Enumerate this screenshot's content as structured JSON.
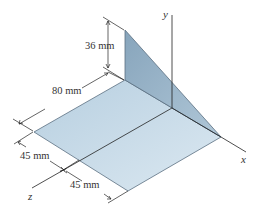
{
  "figure": {
    "type": "isometric-engineering-drawing",
    "axes": {
      "x": "x",
      "y": "y",
      "z": "z"
    },
    "dimensions": {
      "height": "36 mm",
      "depth": "80 mm",
      "width_left": "45 mm",
      "width_right": "45 mm"
    },
    "colors": {
      "plate": "#b9d2e3",
      "plate_light": "#d7e6f0",
      "panel": "#7f9fb8",
      "panel_light": "#9cb8cc",
      "line": "#333333"
    }
  }
}
